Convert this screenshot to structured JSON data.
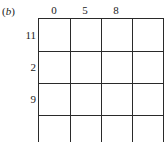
{
  "part_label": "(b)",
  "column_headers": [
    "0",
    "5",
    "8",
    ""
  ],
  "row_headers": [
    "11",
    "2",
    "9",
    ""
  ],
  "grid": {
    "rows": 4,
    "columns": 4,
    "cells": [
      [
        "",
        "",
        "",
        ""
      ],
      [
        "",
        "",
        "",
        ""
      ],
      [
        "",
        "",
        "",
        ""
      ],
      [
        "",
        "",
        "",
        ""
      ]
    ]
  }
}
